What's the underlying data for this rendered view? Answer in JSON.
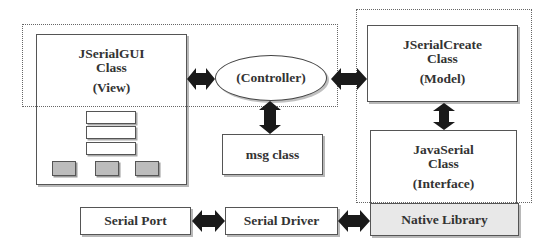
{
  "diagram": {
    "groups": {
      "view_controller_group": {
        "style": "dotted"
      },
      "model_interface_group": {
        "style": "dotted"
      }
    },
    "nodes": {
      "gui": {
        "title": "JSerialGUI",
        "subtitle": "Class",
        "role": "(View)"
      },
      "controller": {
        "label": "(Controller)"
      },
      "msg": {
        "label": "msg class"
      },
      "create": {
        "title": "JSerialCreate",
        "subtitle": "Class",
        "role": "(Model)"
      },
      "javaserial": {
        "title": "JavaSerial",
        "subtitle": "Class",
        "role": "(Interface)"
      },
      "native": {
        "label": "Native Library",
        "fill": "#e8e8e8"
      },
      "serial_port": {
        "label": "Serial Port"
      },
      "serial_driver": {
        "label": "Serial Driver"
      }
    },
    "edges": [
      {
        "from": "gui",
        "to": "controller",
        "type": "bidirectional"
      },
      {
        "from": "controller",
        "to": "create",
        "type": "bidirectional"
      },
      {
        "from": "controller",
        "to": "msg",
        "type": "bidirectional"
      },
      {
        "from": "create",
        "to": "javaserial",
        "type": "bidirectional"
      },
      {
        "from": "serial_port",
        "to": "serial_driver",
        "type": "bidirectional"
      },
      {
        "from": "serial_driver",
        "to": "native",
        "type": "bidirectional"
      }
    ],
    "colors": {
      "stroke": "#444444",
      "arrow": "#1a1a1a",
      "gray_widget": "#bcbcbc",
      "native_fill": "#e8e8e8"
    }
  }
}
